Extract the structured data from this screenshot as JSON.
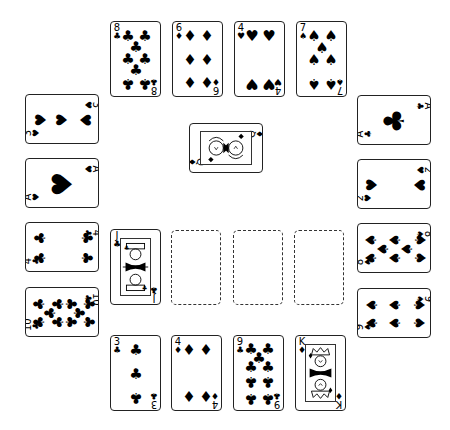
{
  "game": "Solitaire card layout",
  "top_row": [
    {
      "rank": "8",
      "suit": "♣",
      "suit_name": "clubs"
    },
    {
      "rank": "6",
      "suit": "♦",
      "suit_name": "diamonds"
    },
    {
      "rank": "4",
      "suit": "♥",
      "suit_name": "hearts"
    },
    {
      "rank": "7",
      "suit": "♠",
      "suit_name": "spades"
    }
  ],
  "left_column": [
    {
      "rank": "3",
      "suit": "♥",
      "suit_name": "hearts"
    },
    {
      "rank": "A",
      "suit": "♥",
      "suit_name": "hearts"
    },
    {
      "rank": "4",
      "suit": "♣",
      "suit_name": "clubs"
    },
    {
      "rank": "10",
      "suit": "♣",
      "suit_name": "clubs"
    }
  ],
  "right_column": [
    {
      "rank": "A",
      "suit": "♣",
      "suit_name": "clubs"
    },
    {
      "rank": "2",
      "suit": "♥",
      "suit_name": "hearts"
    },
    {
      "rank": "8",
      "suit": "♠",
      "suit_name": "spades"
    },
    {
      "rank": "9",
      "suit": "♠",
      "suit_name": "spades"
    }
  ],
  "center_card": {
    "rank": "Q",
    "suit": "♦",
    "suit_name": "diamonds"
  },
  "middle_row": {
    "card": {
      "rank": "J",
      "suit": "♣",
      "suit_name": "clubs"
    },
    "empty_slots": 3
  },
  "bottom_row": [
    {
      "rank": "3",
      "suit": "♣",
      "suit_name": "clubs"
    },
    {
      "rank": "4",
      "suit": "♦",
      "suit_name": "diamonds"
    },
    {
      "rank": "9",
      "suit": "♣",
      "suit_name": "clubs"
    },
    {
      "rank": "K",
      "suit": "♦",
      "suit_name": "diamonds"
    }
  ],
  "colors": {
    "ink": "#000000",
    "background": "#ffffff",
    "card_border": "#222222"
  }
}
